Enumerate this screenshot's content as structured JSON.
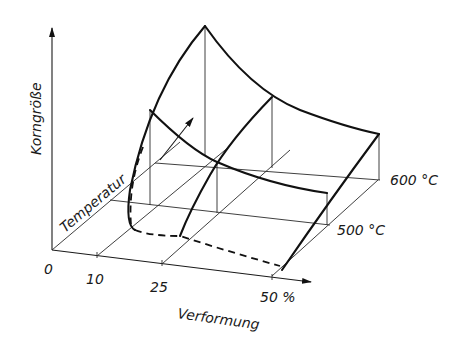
{
  "diagram": {
    "axes": {
      "vertical_label": "Korngröße",
      "depth_label": "Temperatur",
      "horizontal_label": "Verformung",
      "horizontal_ticks": [
        "0",
        "10",
        "25",
        "50 %"
      ],
      "depth_ticks": [
        "500 °C",
        "600 °C"
      ]
    },
    "colors": {
      "line": "#111111",
      "background": "#ffffff"
    }
  }
}
